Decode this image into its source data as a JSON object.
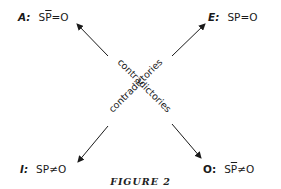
{
  "statements": {
    "A": {
      "key": "A:",
      "subject": "S",
      "predicate": "P",
      "negated_predicate": true,
      "relation": "=",
      "value": "O"
    },
    "E": {
      "key": "E:",
      "subject": "S",
      "predicate": "P",
      "negated_predicate": false,
      "relation": "=",
      "value": "O"
    },
    "I": {
      "key": "I:",
      "subject": "S",
      "predicate": "P",
      "negated_predicate": false,
      "relation": "≠",
      "value": "O"
    },
    "O": {
      "key": "O:",
      "subject": "S",
      "predicate": "P",
      "negated_predicate": true,
      "relation": "≠",
      "value": "O"
    }
  },
  "diagonals": [
    {
      "from": "A",
      "to": "O",
      "label": "contradictories"
    },
    {
      "from": "E",
      "to": "I",
      "label": "contradictories"
    }
  ],
  "caption": "FIGURE 2",
  "colors": {
    "ink": "#1a1a1a",
    "background": "#ffffff"
  }
}
